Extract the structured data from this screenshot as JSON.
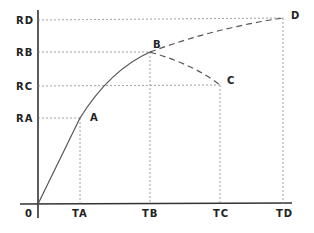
{
  "diagram": {
    "origin_label": "0",
    "y_labels": [
      "RD",
      "RB",
      "RC",
      "RA"
    ],
    "x_labels": [
      "TA",
      "TB",
      "TC",
      "TD"
    ],
    "points": [
      {
        "name": "A",
        "t": "TA",
        "r": "RA"
      },
      {
        "name": "B",
        "t": "TB",
        "r": "RB"
      },
      {
        "name": "C",
        "t": "TC",
        "r": "RC"
      },
      {
        "name": "D",
        "t": "TD",
        "r": "RD"
      }
    ],
    "curves": [
      {
        "from": "0",
        "to": "B",
        "via": "A",
        "style": "solid"
      },
      {
        "from": "B",
        "to": "D",
        "style": "dashed"
      },
      {
        "from": "B",
        "to": "C",
        "style": "dashed"
      }
    ],
    "colors": {
      "line": "#555555",
      "text": "#222222",
      "guide": "#888888"
    }
  }
}
